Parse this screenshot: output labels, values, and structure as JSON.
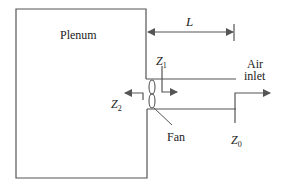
{
  "diagram": {
    "plenum_label": "Plenum",
    "length_label": "L",
    "z1_label": "Z",
    "z1_sub": "1",
    "z2_label": "Z",
    "z2_sub": "2",
    "z0_label": "Z",
    "z0_sub": "0",
    "air_inlet_line1": "Air",
    "air_inlet_line2": "inlet",
    "fan_label": "Fan",
    "line_color": "#555555",
    "text_color": "#222222"
  }
}
